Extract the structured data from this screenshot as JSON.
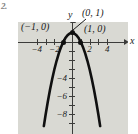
{
  "figure": {
    "problem_number": "2.",
    "panel_bg": "#d9d9d3",
    "ink_color": "#1a1a1a",
    "axis_color": "#3c3c3a"
  },
  "axis_names": {
    "x": "x",
    "y": "y"
  },
  "point_labels": [
    {
      "text": "(0, 1)",
      "name": "label-y-intercept"
    },
    {
      "text": "(−1, 0)",
      "name": "label-x-intercept-left"
    },
    {
      "text": "(1, 0)",
      "name": "label-x-intercept-right"
    }
  ],
  "chart_data": {
    "type": "line",
    "title": "",
    "subtitle": "",
    "xlabel": "x",
    "ylabel": "y",
    "grid": false,
    "legend": "none",
    "xlim": [
      -5,
      5
    ],
    "ylim": [
      -9,
      2.2
    ],
    "x_ticks": [
      -4,
      -2,
      2,
      4
    ],
    "x_tick_labels": [
      "−4",
      "−2",
      "2",
      "4"
    ],
    "y_ticks": [
      -4,
      -6,
      -8
    ],
    "y_tick_labels": [
      "−4",
      "−6",
      "−8"
    ],
    "y_minor_ticks": [
      -1,
      -2,
      -3,
      -5,
      -7,
      1
    ],
    "equation": "y = 1 − x²",
    "series": [
      {
        "name": "y = 1 - x^2",
        "color": "#101010",
        "x": [
          -3.2,
          -3.0,
          -2.75,
          -2.5,
          -2.25,
          -2.0,
          -1.75,
          -1.5,
          -1.25,
          -1.0,
          -0.75,
          -0.5,
          -0.25,
          0,
          0.25,
          0.5,
          0.75,
          1.0,
          1.25,
          1.5,
          1.75,
          2.0,
          2.25,
          2.5,
          2.75,
          3.0,
          3.2
        ],
        "values": [
          -9.24,
          -8.0,
          -6.5625,
          -5.25,
          -4.0625,
          -3.0,
          -2.0625,
          -1.25,
          -0.5625,
          0,
          0.4375,
          0.75,
          0.9375,
          1.0,
          0.9375,
          0.75,
          0.4375,
          0,
          -0.5625,
          -1.25,
          -2.0625,
          -3.0,
          -4.0625,
          -5.25,
          -6.5625,
          -8.0,
          -9.24
        ]
      }
    ],
    "annotated_points": [
      {
        "label": "(0, 1)",
        "x": 0,
        "y": 1
      },
      {
        "label": "(−1, 0)",
        "x": -1,
        "y": 0
      },
      {
        "label": "(1, 0)",
        "x": 1,
        "y": 0
      }
    ]
  }
}
